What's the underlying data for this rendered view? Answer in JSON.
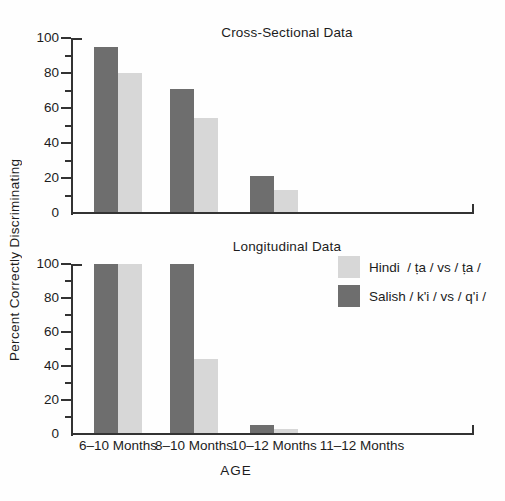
{
  "figure": {
    "ylabel": "Percent Correctly Discriminating",
    "xlabel": "AGE"
  },
  "legend": {
    "items": [
      {
        "id": "hindi",
        "label": "Hindi  / ṭa / vs / ṭa /",
        "color": "#d7d7d7"
      },
      {
        "id": "salish",
        "label": "Salish / k'i / vs / q'i /",
        "color": "#6e6e6e"
      }
    ]
  },
  "chart_data": [
    {
      "type": "bar",
      "title": "Cross-Sectional Data",
      "categories": [
        "6–10 Months",
        "8–10 Months",
        "10–12 Months",
        "11–12 Months"
      ],
      "series": [
        {
          "name": "Salish / k'i / vs / q'i /",
          "color": "#6e6e6e",
          "values": [
            95,
            71,
            21,
            null
          ]
        },
        {
          "name": "Hindi / ṭa / vs / ṭa /",
          "color": "#d7d7d7",
          "values": [
            80,
            54,
            13,
            null
          ]
        }
      ],
      "ylabel": "Percent Correctly Discriminating",
      "xlabel": "AGE",
      "ylim": [
        0,
        100
      ],
      "yticks_major": [
        0,
        20,
        40,
        60,
        80,
        100
      ],
      "yticks_minor": [
        10,
        30,
        50,
        70,
        90
      ],
      "grid": false,
      "legend_position": "none"
    },
    {
      "type": "bar",
      "title": "Longitudinal Data",
      "categories": [
        "6–10 Months",
        "8–10 Months",
        "10–12 Months",
        "11–12 Months"
      ],
      "series": [
        {
          "name": "Salish / k'i / vs / q'i /",
          "color": "#6e6e6e",
          "values": [
            100,
            100,
            5,
            null
          ]
        },
        {
          "name": "Hindi / ṭa / vs / ṭa /",
          "color": "#d7d7d7",
          "values": [
            100,
            44,
            3,
            null
          ]
        }
      ],
      "ylabel": "Percent Correctly Discriminating",
      "xlabel": "AGE",
      "ylim": [
        0,
        100
      ],
      "yticks_major": [
        0,
        20,
        40,
        60,
        80,
        100
      ],
      "yticks_minor": [
        10,
        30,
        50,
        70,
        90
      ],
      "grid": false,
      "legend_position": "right-middle"
    }
  ]
}
